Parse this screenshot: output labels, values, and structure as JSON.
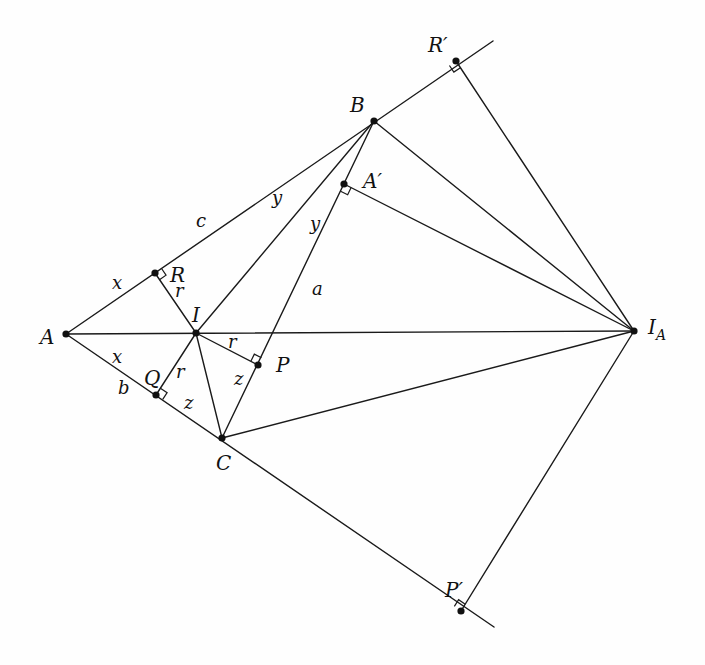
{
  "diagram": {
    "colors": {
      "line": "#1a1a1a",
      "point": "#111111",
      "background": "#fefefe"
    },
    "points": [
      {
        "id": "A",
        "label": "A",
        "x": 66,
        "y": 334,
        "lx": 40,
        "ly": 344,
        "size": 20
      },
      {
        "id": "B",
        "label": "B",
        "x": 374,
        "y": 121,
        "lx": 350,
        "ly": 112,
        "size": 20
      },
      {
        "id": "C",
        "label": "C",
        "x": 222,
        "y": 438,
        "lx": 216,
        "ly": 470,
        "size": 20
      },
      {
        "id": "I",
        "label": "I",
        "x": 196,
        "y": 333,
        "lx": 192,
        "ly": 322,
        "size": 20
      },
      {
        "id": "R",
        "label": "R",
        "x": 155,
        "y": 273,
        "lx": 170,
        "ly": 282,
        "size": 20
      },
      {
        "id": "Q",
        "label": "Q",
        "x": 156,
        "y": 395,
        "lx": 144,
        "ly": 385,
        "size": 20
      },
      {
        "id": "P",
        "label": "P",
        "x": 258,
        "y": 365,
        "lx": 276,
        "ly": 372,
        "size": 20
      },
      {
        "id": "Ap",
        "label": "A′",
        "x": 344,
        "y": 184,
        "lx": 363,
        "ly": 188,
        "size": 20
      },
      {
        "id": "IA",
        "label": "I",
        "sub": "A",
        "x": 634,
        "y": 331,
        "lx": 648,
        "ly": 334,
        "size": 20
      },
      {
        "id": "Rp",
        "label": "R′",
        "x": 456,
        "y": 61,
        "lx": 428,
        "ly": 52,
        "size": 20
      },
      {
        "id": "Pp",
        "label": "P′",
        "x": 461,
        "y": 611,
        "lx": 445,
        "ly": 597,
        "size": 20
      }
    ],
    "segments": [
      {
        "from": [
          66,
          334
        ],
        "to": [
          493,
          41
        ],
        "name": "line-AB-extended"
      },
      {
        "from": [
          66,
          334
        ],
        "to": [
          494,
          627
        ],
        "name": "line-AC-extended"
      },
      {
        "from": [
          66,
          334
        ],
        "to": [
          634,
          331
        ],
        "name": "segment-A-IA"
      },
      {
        "from": [
          374,
          121
        ],
        "to": [
          222,
          438
        ],
        "name": "segment-BC"
      },
      {
        "from": [
          374,
          121
        ],
        "to": [
          196,
          333
        ],
        "name": "segment-BI"
      },
      {
        "from": [
          374,
          121
        ],
        "to": [
          634,
          331
        ],
        "name": "segment-B-IA"
      },
      {
        "from": [
          222,
          438
        ],
        "to": [
          634,
          331
        ],
        "name": "segment-C-IA"
      },
      {
        "from": [
          196,
          333
        ],
        "to": [
          222,
          438
        ],
        "name": "segment-IC"
      },
      {
        "from": [
          196,
          333
        ],
        "to": [
          155,
          273
        ],
        "name": "segment-IR"
      },
      {
        "from": [
          196,
          333
        ],
        "to": [
          156,
          395
        ],
        "name": "segment-IQ"
      },
      {
        "from": [
          196,
          333
        ],
        "to": [
          258,
          365
        ],
        "name": "segment-IP"
      },
      {
        "from": [
          344,
          184
        ],
        "to": [
          634,
          331
        ],
        "name": "segment-Ap-IA"
      },
      {
        "from": [
          456,
          61
        ],
        "to": [
          634,
          331
        ],
        "name": "segment-Rp-IA"
      },
      {
        "from": [
          461,
          611
        ],
        "to": [
          634,
          331
        ],
        "name": "segment-Pp-IA"
      }
    ],
    "right_angles": [
      {
        "at": [
          155,
          273
        ],
        "u": [
          0.82,
          -0.56
        ],
        "v": [
          0.56,
          0.83
        ],
        "name": "right-angle-R"
      },
      {
        "at": [
          156,
          395
        ],
        "u": [
          0.84,
          0.55
        ],
        "v": [
          0.55,
          -0.84
        ],
        "name": "right-angle-Q"
      },
      {
        "at": [
          258,
          365
        ],
        "u": [
          0.43,
          -0.9
        ],
        "v": [
          -0.89,
          -0.46
        ],
        "name": "right-angle-P"
      },
      {
        "at": [
          344,
          184
        ],
        "u": [
          -0.43,
          0.9
        ],
        "v": [
          0.89,
          0.45
        ],
        "name": "right-angle-Ap"
      },
      {
        "at": [
          456,
          61
        ],
        "u": [
          -0.82,
          0.56
        ],
        "v": [
          0.55,
          0.83
        ],
        "name": "right-angle-Rp"
      },
      {
        "at": [
          461,
          611
        ],
        "u": [
          -0.83,
          -0.57
        ],
        "v": [
          0.53,
          -0.85
        ],
        "name": "right-angle-Pp"
      }
    ],
    "edge_labels": [
      {
        "text": "x",
        "x": 112,
        "y": 289,
        "name": "label-x-upper"
      },
      {
        "text": "x",
        "x": 112,
        "y": 363,
        "name": "label-x-lower"
      },
      {
        "text": "b",
        "x": 118,
        "y": 394,
        "name": "label-b"
      },
      {
        "text": "c",
        "x": 196,
        "y": 227,
        "name": "label-c"
      },
      {
        "text": "y",
        "x": 272,
        "y": 204,
        "name": "label-y-ab"
      },
      {
        "text": "y",
        "x": 310,
        "y": 230,
        "name": "label-y-bc"
      },
      {
        "text": "a",
        "x": 312,
        "y": 295,
        "name": "label-a"
      },
      {
        "text": "r",
        "x": 175,
        "y": 297,
        "name": "label-r-IR"
      },
      {
        "text": "r",
        "x": 176,
        "y": 378,
        "name": "label-r-IQ"
      },
      {
        "text": "r",
        "x": 228,
        "y": 348,
        "name": "label-r-IP"
      },
      {
        "text": "z",
        "x": 184,
        "y": 409,
        "name": "label-z-QC"
      },
      {
        "text": "z",
        "x": 234,
        "y": 385,
        "name": "label-z-PC"
      }
    ]
  }
}
